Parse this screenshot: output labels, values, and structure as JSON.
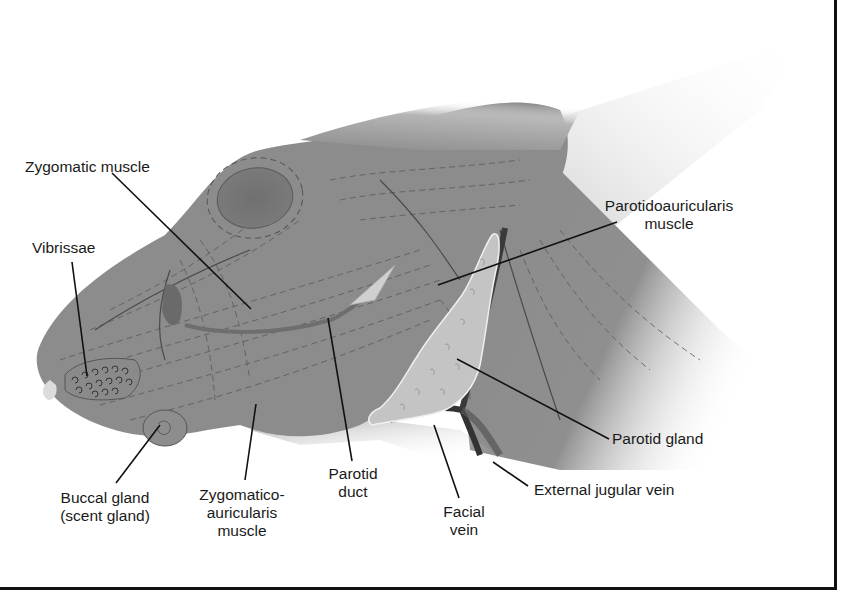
{
  "diagram": {
    "colors": {
      "muscle": "#8c8c8c",
      "muscle_dark": "#6f6f6f",
      "eye": "#767676",
      "gland": "#c4c4c4",
      "vein": "#3a3a3a",
      "leader": "#111111",
      "text": "#1a1a1a"
    },
    "labels": {
      "zygomatic_muscle": "Zygomatic muscle",
      "vibrissae": "Vibrissae",
      "parotidoauricularis_line1": "Parotidoauricularis",
      "parotidoauricularis_line2": "muscle",
      "parotid_gland": "Parotid gland",
      "external_jugular_vein": "External jugular vein",
      "facial_vein_line1": "Facial",
      "facial_vein_line2": "vein",
      "parotid_duct_line1": "Parotid",
      "parotid_duct_line2": "duct",
      "zygomatico_line1": "Zygomatico-",
      "zygomatico_line2": "auricularis",
      "zygomatico_line3": "muscle",
      "buccal_line1": "Buccal gland",
      "buccal_line2": "(scent gland)"
    }
  }
}
